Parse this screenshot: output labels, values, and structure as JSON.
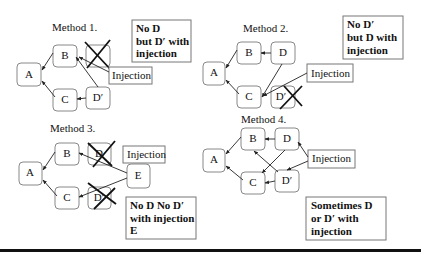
{
  "methods": [
    {
      "title": "Method 1.",
      "nodes": {
        "A": "A",
        "B": "B",
        "C": "C",
        "D": "",
        "Dp": "D′"
      },
      "injection": "Injection",
      "note": [
        "No D",
        "but D′ with",
        "injection"
      ]
    },
    {
      "title": "Method 2.",
      "nodes": {
        "A": "A",
        "B": "B",
        "C": "C",
        "D": "D",
        "Dp": "D′"
      },
      "injection": "Injection",
      "note": [
        "No D′",
        "but D with",
        "injection"
      ]
    },
    {
      "title": "Method 3.",
      "nodes": {
        "A": "A",
        "B": "B",
        "C": "C",
        "D": "D",
        "Dp": "D′",
        "E": "E"
      },
      "injection": "Injection",
      "note": [
        "No D No D′",
        "with injection",
        "E"
      ]
    },
    {
      "title": "Method 4.",
      "nodes": {
        "A": "A",
        "B": "B",
        "C": "C",
        "D": "D",
        "Dp": "D′"
      },
      "injection": "Injection",
      "note": [
        "Sometimes D",
        "or D′ with",
        "injection"
      ]
    }
  ],
  "colors": {
    "stroke": "#888888",
    "text": "#111111",
    "rule": "#111111"
  }
}
